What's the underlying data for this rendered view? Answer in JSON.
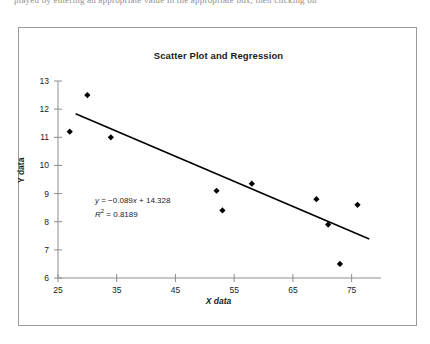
{
  "page": {
    "scan_text_fragment": "played by entering an appropriate value in the appropriate box, then clicking on"
  },
  "chart_data": {
    "type": "scatter",
    "title": "Scatter Plot and Regression",
    "xlabel": "X data",
    "ylabel": "Y data",
    "xlim": [
      25,
      80
    ],
    "ylim": [
      6,
      13
    ],
    "xticks": [
      25,
      35,
      45,
      55,
      65,
      75
    ],
    "yticks": [
      6,
      7,
      8,
      9,
      10,
      11,
      12,
      13
    ],
    "grid": false,
    "legend": "none",
    "marker": "diamond",
    "marker_color": "#000000",
    "line_color": "#000000",
    "points": [
      {
        "x": 30,
        "y": 12.5
      },
      {
        "x": 27,
        "y": 11.2
      },
      {
        "x": 34,
        "y": 11.0
      },
      {
        "x": 52,
        "y": 9.1
      },
      {
        "x": 53,
        "y": 8.4
      },
      {
        "x": 58,
        "y": 9.35
      },
      {
        "x": 69,
        "y": 8.8
      },
      {
        "x": 71,
        "y": 7.9
      },
      {
        "x": 73,
        "y": 6.5
      },
      {
        "x": 76,
        "y": 8.6
      }
    ],
    "trendline": {
      "slope": -0.089,
      "intercept": 14.328,
      "x_start": 28,
      "x_end": 78,
      "equation": "y = −0.089x + 14.328",
      "equation_prefix": "y",
      "equation_body": " = −0.089",
      "equation_var": "x",
      "equation_suffix": " + 14.328",
      "r_squared_label": "R",
      "r_squared_exp": "2",
      "r_squared_value": " = 0.8189"
    }
  }
}
